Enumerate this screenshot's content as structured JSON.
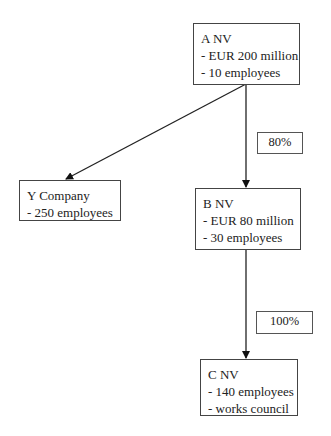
{
  "nodes": {
    "a": {
      "title": "A NV",
      "lines": [
        "- EUR 200 million",
        "- 10 employees"
      ]
    },
    "y": {
      "title": "Y Company",
      "lines": [
        "- 250 employees"
      ]
    },
    "b": {
      "title": "B NV",
      "lines": [
        "- EUR 80 million",
        "- 30 employees"
      ]
    },
    "c": {
      "title": "C NV",
      "lines": [
        "- 140 employees",
        "- works council"
      ]
    }
  },
  "edges": [
    {
      "from": "A NV",
      "to": "Y Company",
      "label": ""
    },
    {
      "from": "A NV",
      "to": "B NV",
      "label": "80%"
    },
    {
      "from": "B NV",
      "to": "C NV",
      "label": "100%"
    }
  ],
  "labels": {
    "ab": "80%",
    "bc": "100%"
  }
}
